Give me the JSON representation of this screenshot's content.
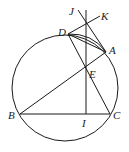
{
  "diagram": {
    "type": "geometry",
    "circle": {
      "cx": 65,
      "cy": 88,
      "r": 53
    },
    "points": {
      "J": {
        "label": "J",
        "x": 78,
        "y": 10,
        "lx": 69,
        "ly": 15
      },
      "K": {
        "label": "K",
        "x": 100,
        "y": 16,
        "lx": 101,
        "ly": 20
      },
      "D": {
        "label": "D",
        "x": 68,
        "y": 34,
        "lx": 58,
        "ly": 35
      },
      "A": {
        "label": "A",
        "x": 106,
        "y": 52,
        "lx": 109,
        "ly": 53
      },
      "E": {
        "label": "E",
        "x": 86,
        "y": 69,
        "lx": 89,
        "ly": 78
      },
      "B": {
        "label": "B",
        "x": 20,
        "y": 114,
        "lx": 8,
        "ly": 119
      },
      "I": {
        "label": "I",
        "x": 86,
        "y": 114,
        "lx": 82,
        "ly": 126
      },
      "C": {
        "label": "C",
        "x": 110,
        "y": 114,
        "lx": 113,
        "ly": 119
      }
    },
    "segments": [
      [
        "B",
        "C"
      ],
      [
        "B",
        "A"
      ],
      [
        "D",
        "C"
      ],
      [
        "D",
        "A"
      ],
      [
        "D",
        "K"
      ],
      [
        "J",
        "A"
      ]
    ],
    "vertical_line": {
      "x": 86,
      "y1": 10,
      "y2": 114
    }
  }
}
